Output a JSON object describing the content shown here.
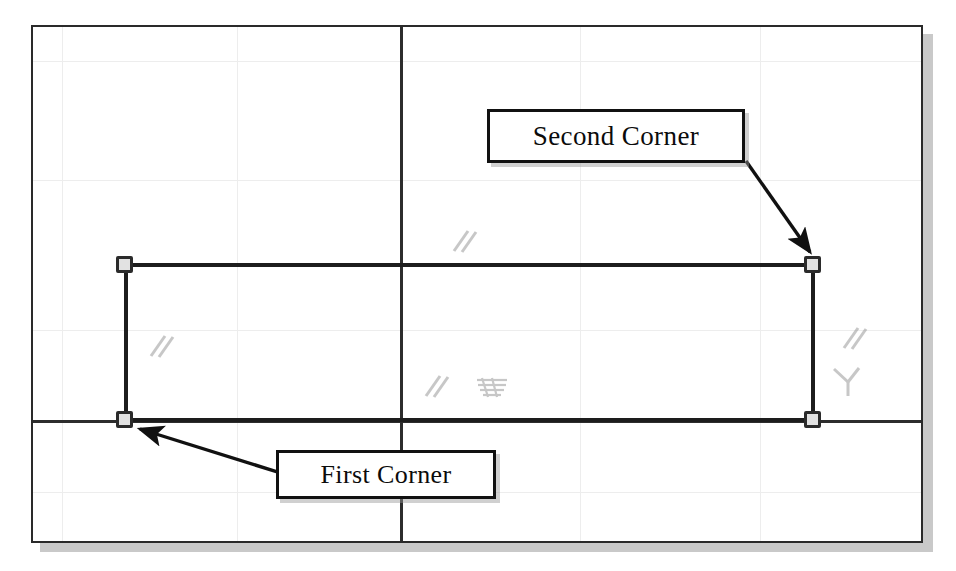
{
  "figure": {
    "background_color": "#ffffff",
    "frame_border_color": "#2a2a2a",
    "shadow_color": "#bfbfbf"
  },
  "callouts": [
    {
      "id": "second-corner",
      "label": "Second Corner",
      "x": 487,
      "y": 109,
      "width": 258,
      "height": 54,
      "points_to": "top-right-grip"
    },
    {
      "id": "first-corner",
      "label": "First Corner",
      "x": 276,
      "y": 450,
      "width": 220,
      "height": 49,
      "points_to": "bottom-left-grip"
    }
  ],
  "rectangle": {
    "left": 124,
    "top": 265,
    "right": 813,
    "bottom": 420,
    "edge_color": "#1d1d1d"
  },
  "grips": [
    {
      "name": "top-left-grip",
      "x": 124,
      "y": 265
    },
    {
      "name": "top-right-grip",
      "x": 813,
      "y": 265
    },
    {
      "name": "bottom-left-grip",
      "x": 124,
      "y": 420
    },
    {
      "name": "bottom-right-grip",
      "x": 813,
      "y": 420
    }
  ],
  "axes": {
    "vertical_x": 400,
    "horizontal_y": 420,
    "color": "#2d2d2d"
  },
  "grid": {
    "color": "#ededed",
    "vertical_x": [
      62,
      237,
      580,
      760
    ],
    "horizontal_y": [
      61,
      180,
      330,
      492
    ]
  },
  "artifacts": [
    {
      "name": "slash-mark-upper-center",
      "x": 448,
      "y": 225,
      "kind": "double-slash"
    },
    {
      "name": "slash-mark-left",
      "x": 145,
      "y": 330,
      "kind": "double-slash"
    },
    {
      "name": "slash-mark-center",
      "x": 420,
      "y": 370,
      "kind": "double-slash"
    },
    {
      "name": "hatch-mark-center",
      "x": 476,
      "y": 372,
      "kind": "hatch-block"
    },
    {
      "name": "slash-mark-right",
      "x": 838,
      "y": 322,
      "kind": "double-slash"
    },
    {
      "name": "tee-mark-right",
      "x": 832,
      "y": 365,
      "kind": "tee"
    }
  ]
}
